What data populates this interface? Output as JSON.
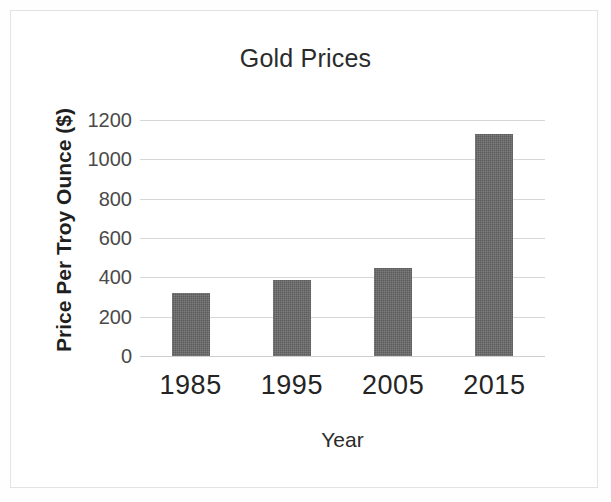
{
  "chart_data": {
    "type": "bar",
    "title": "Gold Prices",
    "xlabel": "Year",
    "ylabel": "Price Per Troy Ounce ($)",
    "categories": [
      "1985",
      "1995",
      "2005",
      "2015"
    ],
    "values": [
      320,
      385,
      445,
      1130
    ],
    "series": [
      {
        "name": "Price Per Troy Ounce ($)",
        "values": [
          320,
          385,
          445,
          1130
        ]
      }
    ],
    "ylim": [
      0,
      1200
    ],
    "yticks": [
      0,
      200,
      400,
      600,
      800,
      1000,
      1200
    ],
    "ytick_labels": [
      "0",
      "200",
      "400",
      "600",
      "800",
      "1000",
      "1200"
    ],
    "grid": true,
    "legend": false,
    "legend_position": "none",
    "bar_color": "#5c5c5c",
    "gridline_color": "#d6d6d6",
    "background_color": "#ffffff"
  }
}
